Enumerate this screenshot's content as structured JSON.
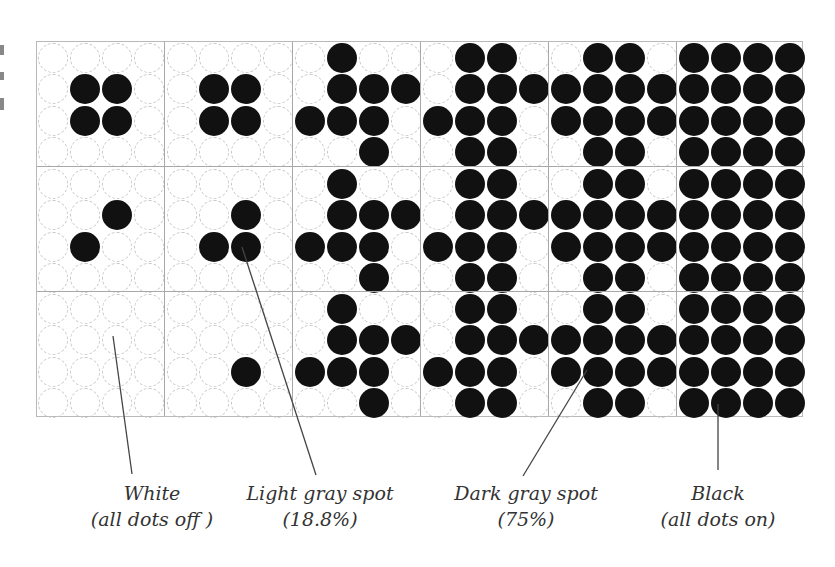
{
  "figure": {
    "grid": {
      "columns": 6,
      "rows": 3,
      "dots_per_cell": 4,
      "cell_width": 128,
      "cell_height": 125,
      "dot_spacing": 32,
      "on_color": "#111111",
      "off_outline_color": "#c8c8c8"
    },
    "cells": [
      [
        {
          "on": [
            [
              1,
              1
            ],
            [
              1,
              2
            ],
            [
              2,
              1
            ],
            [
              2,
              2
            ]
          ]
        },
        {
          "on": [
            [
              1,
              1
            ],
            [
              1,
              2
            ],
            [
              2,
              1
            ],
            [
              2,
              2
            ]
          ]
        },
        {
          "on": [
            [
              0,
              1
            ],
            [
              1,
              1
            ],
            [
              1,
              2
            ],
            [
              1,
              3
            ],
            [
              2,
              0
            ],
            [
              2,
              1
            ],
            [
              2,
              2
            ],
            [
              3,
              2
            ]
          ]
        },
        {
          "on": [
            [
              0,
              1
            ],
            [
              0,
              2
            ],
            [
              1,
              1
            ],
            [
              1,
              2
            ],
            [
              1,
              3
            ],
            [
              2,
              0
            ],
            [
              2,
              1
            ],
            [
              2,
              2
            ],
            [
              3,
              1
            ],
            [
              3,
              2
            ]
          ]
        },
        {
          "on": [
            [
              0,
              1
            ],
            [
              0,
              2
            ],
            [
              1,
              0
            ],
            [
              1,
              1
            ],
            [
              1,
              2
            ],
            [
              1,
              3
            ],
            [
              2,
              0
            ],
            [
              2,
              1
            ],
            [
              2,
              2
            ],
            [
              2,
              3
            ],
            [
              3,
              1
            ],
            [
              3,
              2
            ]
          ]
        },
        {
          "on": "all"
        }
      ],
      [
        {
          "on": [
            [
              1,
              2
            ],
            [
              2,
              1
            ]
          ]
        },
        {
          "on": [
            [
              1,
              2
            ],
            [
              2,
              1
            ],
            [
              2,
              2
            ]
          ]
        },
        {
          "on": [
            [
              0,
              1
            ],
            [
              1,
              1
            ],
            [
              1,
              2
            ],
            [
              1,
              3
            ],
            [
              2,
              0
            ],
            [
              2,
              1
            ],
            [
              2,
              2
            ],
            [
              3,
              2
            ]
          ]
        },
        {
          "on": [
            [
              0,
              1
            ],
            [
              0,
              2
            ],
            [
              1,
              1
            ],
            [
              1,
              2
            ],
            [
              1,
              3
            ],
            [
              2,
              0
            ],
            [
              2,
              1
            ],
            [
              2,
              2
            ],
            [
              3,
              1
            ],
            [
              3,
              2
            ]
          ]
        },
        {
          "on": [
            [
              0,
              1
            ],
            [
              0,
              2
            ],
            [
              1,
              0
            ],
            [
              1,
              1
            ],
            [
              1,
              2
            ],
            [
              1,
              3
            ],
            [
              2,
              0
            ],
            [
              2,
              1
            ],
            [
              2,
              2
            ],
            [
              2,
              3
            ],
            [
              3,
              1
            ],
            [
              3,
              2
            ]
          ]
        },
        {
          "on": "all"
        }
      ],
      [
        {
          "on": []
        },
        {
          "on": [
            [
              2,
              2
            ]
          ]
        },
        {
          "on": [
            [
              0,
              1
            ],
            [
              1,
              1
            ],
            [
              1,
              2
            ],
            [
              1,
              3
            ],
            [
              2,
              0
            ],
            [
              2,
              1
            ],
            [
              2,
              2
            ],
            [
              3,
              2
            ]
          ]
        },
        {
          "on": [
            [
              0,
              1
            ],
            [
              0,
              2
            ],
            [
              1,
              1
            ],
            [
              1,
              2
            ],
            [
              1,
              3
            ],
            [
              2,
              0
            ],
            [
              2,
              1
            ],
            [
              2,
              2
            ],
            [
              3,
              1
            ],
            [
              3,
              2
            ]
          ]
        },
        {
          "on": [
            [
              0,
              1
            ],
            [
              0,
              2
            ],
            [
              1,
              0
            ],
            [
              1,
              1
            ],
            [
              1,
              2
            ],
            [
              1,
              3
            ],
            [
              2,
              0
            ],
            [
              2,
              1
            ],
            [
              2,
              2
            ],
            [
              2,
              3
            ],
            [
              3,
              1
            ],
            [
              3,
              2
            ]
          ]
        },
        {
          "on": "all"
        }
      ]
    ],
    "labels": [
      {
        "id": "white",
        "line1": "White",
        "line2": "(all dots off )",
        "x": 152,
        "y": 480,
        "leader": {
          "x1": 113,
          "y1": 336,
          "x2": 132,
          "y2": 474
        }
      },
      {
        "id": "light-gray",
        "line1": "Light gray spot",
        "line2": "(18.8%)",
        "x": 320,
        "y": 480,
        "leader": {
          "x1": 242,
          "y1": 247,
          "x2": 316,
          "y2": 475
        }
      },
      {
        "id": "dark-gray",
        "line1": "Dark gray spot",
        "line2": "(75%)",
        "x": 526,
        "y": 480,
        "leader": {
          "x1": 587,
          "y1": 370,
          "x2": 523,
          "y2": 476
        }
      },
      {
        "id": "black",
        "line1": "Black",
        "line2": "(all dots on)",
        "x": 718,
        "y": 480,
        "leader": {
          "x1": 718,
          "y1": 404,
          "x2": 718,
          "y2": 470
        }
      }
    ],
    "leader_color": "#444444"
  }
}
